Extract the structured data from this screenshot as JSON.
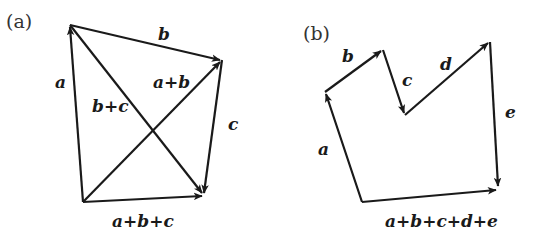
{
  "panels": [
    {
      "id": "a",
      "label": "(a)",
      "vertices": {
        "O": [
          83,
          202
        ],
        "A": [
          70,
          25
        ],
        "B": [
          222,
          60
        ],
        "C": [
          204,
          195
        ]
      },
      "vectors": [
        {
          "name": "a",
          "from": "O",
          "to": "A",
          "label": "a"
        },
        {
          "name": "b",
          "from": "A",
          "to": "B",
          "label": "b"
        },
        {
          "name": "c",
          "from": "B",
          "to": "C",
          "label": "c"
        },
        {
          "name": "a+b",
          "from": "O",
          "to": "B",
          "label": "a+b"
        },
        {
          "name": "b+c",
          "from": "A",
          "to": "C",
          "label": "b+c"
        },
        {
          "name": "a+b+c",
          "from": "O",
          "to": "C",
          "label": "a+b+c"
        }
      ]
    },
    {
      "id": "b",
      "label": "(b)",
      "vertices": {
        "O": [
          362,
          202
        ],
        "P1": [
          325,
          92
        ],
        "P2": [
          383,
          50
        ],
        "P3": [
          405,
          115
        ],
        "P4": [
          490,
          42
        ],
        "P5": [
          498,
          188
        ]
      },
      "vectors": [
        {
          "name": "a",
          "from": "O",
          "to": "P1",
          "label": "a"
        },
        {
          "name": "b",
          "from": "P1",
          "to": "P2",
          "label": "b"
        },
        {
          "name": "c",
          "from": "P2",
          "to": "P3",
          "label": "c"
        },
        {
          "name": "d",
          "from": "P3",
          "to": "P4",
          "label": "d"
        },
        {
          "name": "e",
          "from": "P4",
          "to": "P5",
          "label": "e"
        },
        {
          "name": "a+b+c+d+e",
          "from": "O",
          "to": "P5",
          "label": "a+b+c+d+e"
        }
      ]
    }
  ],
  "labels": {
    "panel_a": "(a)",
    "panel_b": "(b)",
    "a_a": "a",
    "a_b": "b",
    "a_c": "c",
    "a_ab": "a+b",
    "a_bc": "b+c",
    "a_abc": "a+b+c",
    "b_a": "a",
    "b_b": "b",
    "b_c": "c",
    "b_d": "d",
    "b_e": "e",
    "b_sum": "a+b+c+d+e"
  }
}
